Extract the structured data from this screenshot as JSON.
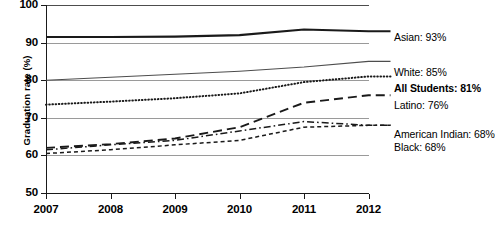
{
  "chart_data": {
    "type": "line",
    "title": "",
    "xlabel": "",
    "ylabel": "Graduation rate (%)",
    "x": [
      2007,
      2008,
      2009,
      2010,
      2011,
      2012
    ],
    "xtick_labels": [
      "2007",
      "2008",
      "2009",
      "2010",
      "2011",
      "2012"
    ],
    "ytick_labels": [
      "50",
      "60",
      "70",
      "80",
      "90",
      "100"
    ],
    "ylim": [
      50,
      100
    ],
    "ytick_values": [
      50,
      60,
      70,
      80,
      90,
      100
    ],
    "grid": "horizontal",
    "legend_position": "right-inline-end-labels",
    "series": [
      {
        "name": "Asian",
        "end_label": "Asian: 93%",
        "end_value": 93,
        "style": "solid-thick",
        "color": "#1a1a1a",
        "values": [
          91.5,
          91.5,
          91.6,
          92.0,
          93.5,
          93.0
        ]
      },
      {
        "name": "White",
        "end_label": "White: 85%",
        "end_value": 85,
        "style": "solid-thin",
        "color": "#4d4d4d",
        "values": [
          80.0,
          80.8,
          81.6,
          82.4,
          83.5,
          85.0
        ]
      },
      {
        "name": "All Students",
        "end_label": "All Students: 81%",
        "end_value": 81,
        "style": "dotted",
        "color": "#1a1a1a",
        "emphasis": "bold",
        "values": [
          73.5,
          74.3,
          75.2,
          76.5,
          79.5,
          81.0
        ]
      },
      {
        "name": "Latino",
        "end_label": "Latino: 76%",
        "end_value": 76,
        "style": "long-dash",
        "color": "#1a1a1a",
        "values": [
          62.0,
          63.0,
          64.5,
          67.5,
          74.0,
          76.0
        ]
      },
      {
        "name": "American Indian",
        "end_label": "American Indian: 68%",
        "end_value": 68,
        "style": "dash-dot",
        "color": "#1a1a1a",
        "values": [
          61.5,
          62.8,
          64.0,
          66.5,
          69.0,
          68.0
        ]
      },
      {
        "name": "Black",
        "end_label": "Black: 68%",
        "end_value": 68,
        "style": "short-dash",
        "color": "#1a1a1a",
        "values": [
          60.5,
          61.5,
          62.8,
          64.0,
          67.5,
          68.0
        ]
      }
    ]
  }
}
